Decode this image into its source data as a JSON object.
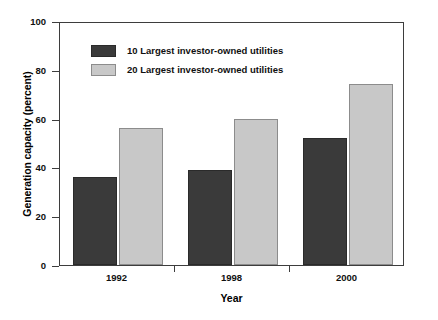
{
  "chart_data": {
    "type": "bar",
    "title": "",
    "subtitle": "",
    "xlabel": "Year",
    "ylabel": "Generation capacity (percent)",
    "categories": [
      "1992",
      "1998",
      "2000"
    ],
    "series": [
      {
        "name": "10 Largest investor-owned utilities",
        "color": "#3a3a3a",
        "values": [
          36,
          39,
          52
        ]
      },
      {
        "name": "20 Largest investor-owned utilities",
        "color": "#c8c8c8",
        "values": [
          56,
          60,
          74
        ]
      }
    ],
    "ylim": [
      0,
      100
    ],
    "yticks": [
      0,
      20,
      40,
      60,
      80,
      100
    ],
    "ytick_labels": [
      "0",
      "20",
      "40",
      "60",
      "80",
      "100"
    ],
    "xtick_labels": [
      "1992",
      "1998",
      "2000"
    ],
    "grid": false,
    "legend_position": "upper-left-inside",
    "frame": "box"
  }
}
